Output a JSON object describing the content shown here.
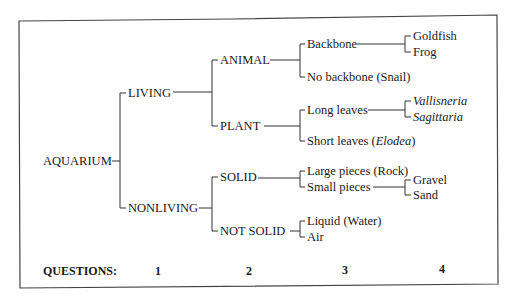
{
  "diagram": {
    "type": "classification-tree",
    "root": "AQUARIUM",
    "level1": {
      "living": "LIVING",
      "nonliving": "NONLIVING"
    },
    "level2": {
      "animal": "ANIMAL",
      "plant": "PLANT",
      "solid": "SOLID",
      "not_solid": "NOT SOLID"
    },
    "level3": {
      "backbone": "Backbone",
      "no_backbone": "No backbone (Snail)",
      "long_leaves": "Long leaves",
      "short_leaves_prefix": "Short leaves (",
      "short_leaves_italic": "Elodea",
      "short_leaves_suffix": ")",
      "large_pieces": "Large pieces (Rock)",
      "small_pieces": "Small pieces",
      "liquid": "Liquid (Water)",
      "air": "Air"
    },
    "level4": {
      "goldfish": "Goldfish",
      "frog": "Frog",
      "vallisneria": "Vallisneria",
      "sagittaria": "Sagittaria",
      "gravel": "Gravel",
      "sand": "Sand"
    },
    "questions": {
      "label": "QUESTIONS:",
      "numbers": [
        "1",
        "2",
        "3",
        "4"
      ]
    }
  }
}
